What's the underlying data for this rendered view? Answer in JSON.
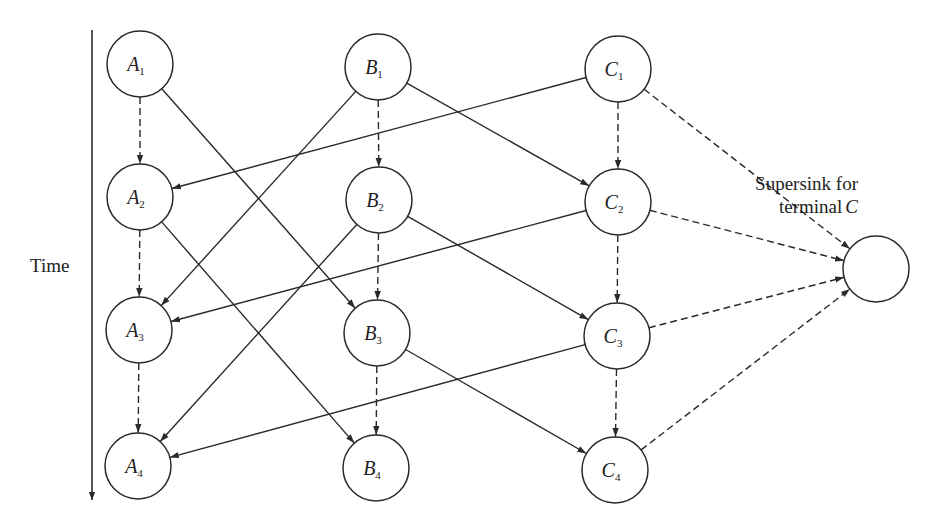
{
  "diagram": {
    "axis": {
      "label": "Time",
      "x": 92,
      "y_start": 30,
      "y_end": 500
    },
    "supersink": {
      "line1": "Supersink for",
      "line2": "terminal",
      "line2_italic": "C",
      "cx": 876,
      "cy": 269,
      "r": 33
    },
    "node_radius": 33,
    "nodes": [
      {
        "id": "A1",
        "letter": "A",
        "sub": "1",
        "cx": 140,
        "cy": 64
      },
      {
        "id": "A2",
        "letter": "A",
        "sub": "2",
        "cx": 140,
        "cy": 197
      },
      {
        "id": "A3",
        "letter": "A",
        "sub": "3",
        "cx": 139,
        "cy": 330
      },
      {
        "id": "A4",
        "letter": "A",
        "sub": "4",
        "cx": 138,
        "cy": 466
      },
      {
        "id": "B1",
        "letter": "B",
        "sub": "1",
        "cx": 378,
        "cy": 67
      },
      {
        "id": "B2",
        "letter": "B",
        "sub": "2",
        "cx": 379,
        "cy": 200
      },
      {
        "id": "B3",
        "letter": "B",
        "sub": "3",
        "cx": 377,
        "cy": 333
      },
      {
        "id": "B4",
        "letter": "B",
        "sub": "4",
        "cx": 376,
        "cy": 468
      },
      {
        "id": "C1",
        "letter": "C",
        "sub": "1",
        "cx": 618,
        "cy": 69
      },
      {
        "id": "C2",
        "letter": "C",
        "sub": "2",
        "cx": 618,
        "cy": 202
      },
      {
        "id": "C3",
        "letter": "C",
        "sub": "3",
        "cx": 617,
        "cy": 336
      },
      {
        "id": "C4",
        "letter": "C",
        "sub": "4",
        "cx": 615,
        "cy": 470
      }
    ],
    "edges": [
      {
        "from": "A1",
        "to": "A2",
        "style": "dashed"
      },
      {
        "from": "A2",
        "to": "A3",
        "style": "dashed"
      },
      {
        "from": "A3",
        "to": "A4",
        "style": "dashed"
      },
      {
        "from": "B1",
        "to": "B2",
        "style": "dashed"
      },
      {
        "from": "B2",
        "to": "B3",
        "style": "dashed"
      },
      {
        "from": "B3",
        "to": "B4",
        "style": "dashed"
      },
      {
        "from": "C1",
        "to": "C2",
        "style": "dashed"
      },
      {
        "from": "C2",
        "to": "C3",
        "style": "dashed"
      },
      {
        "from": "C3",
        "to": "C4",
        "style": "dashed"
      },
      {
        "from": "A1",
        "to": "B3",
        "style": "solid"
      },
      {
        "from": "A2",
        "to": "B4",
        "style": "solid"
      },
      {
        "from": "B1",
        "to": "A3",
        "style": "solid"
      },
      {
        "from": "B2",
        "to": "A4",
        "style": "solid"
      },
      {
        "from": "B1",
        "to": "C2",
        "style": "solid"
      },
      {
        "from": "B2",
        "to": "C3",
        "style": "solid"
      },
      {
        "from": "B3",
        "to": "C4",
        "style": "solid"
      },
      {
        "from": "C1",
        "to": "A2",
        "style": "solid"
      },
      {
        "from": "C2",
        "to": "A3",
        "style": "solid"
      },
      {
        "from": "C3",
        "to": "A4",
        "style": "solid"
      },
      {
        "from": "C1",
        "to": "SINK",
        "style": "dashed"
      },
      {
        "from": "C2",
        "to": "SINK",
        "style": "dashed"
      },
      {
        "from": "C3",
        "to": "SINK",
        "style": "dashed"
      },
      {
        "from": "C4",
        "to": "SINK",
        "style": "dashed"
      }
    ],
    "colors": {
      "stroke": "#2a2a2a",
      "background": "#ffffff"
    }
  }
}
